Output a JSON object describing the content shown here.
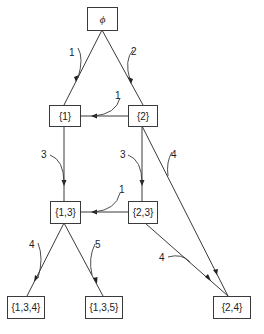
{
  "diagram": {
    "type": "search tree / lattice of subsets",
    "nodes": [
      {
        "id": "empty",
        "label": "ϕ"
      },
      {
        "id": "n1",
        "label": "{1}"
      },
      {
        "id": "n2",
        "label": "{2}"
      },
      {
        "id": "n13",
        "label": "{1,3}"
      },
      {
        "id": "n23",
        "label": "{2,3}"
      },
      {
        "id": "n134",
        "label": "{1,3,4}"
      },
      {
        "id": "n135",
        "label": "{1,3,5}"
      },
      {
        "id": "n24",
        "label": "{2,4}"
      }
    ],
    "edges": [
      {
        "from": "empty",
        "to": "n1",
        "label": "1"
      },
      {
        "from": "empty",
        "to": "n2",
        "label": "2"
      },
      {
        "from": "n2",
        "to": "n1",
        "label": "1"
      },
      {
        "from": "n1",
        "to": "n13",
        "label": "3"
      },
      {
        "from": "n2",
        "to": "n23",
        "label": "3"
      },
      {
        "from": "n2",
        "to": "n24",
        "label": "4"
      },
      {
        "from": "n23",
        "to": "n13",
        "label": "1"
      },
      {
        "from": "n13",
        "to": "n134",
        "label": "4"
      },
      {
        "from": "n13",
        "to": "n135",
        "label": "5"
      },
      {
        "from": "n23",
        "to": "n24",
        "label": "4"
      }
    ]
  }
}
